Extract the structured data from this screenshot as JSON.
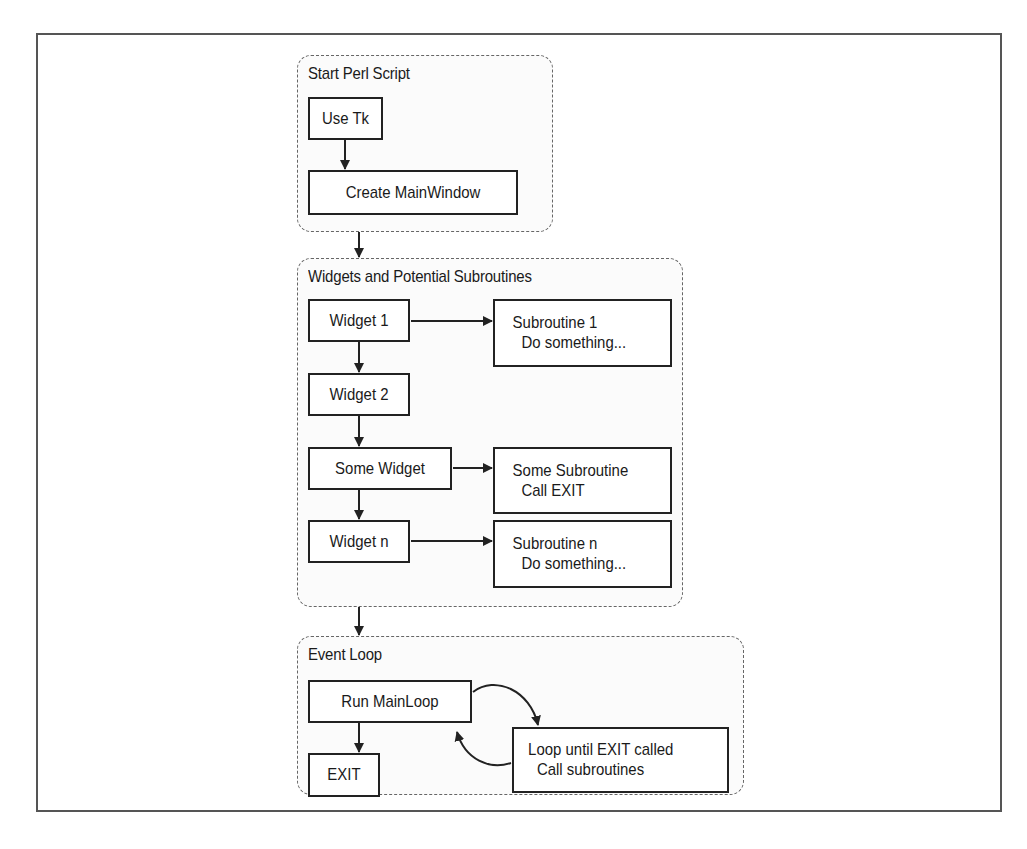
{
  "diagram": {
    "groups": [
      {
        "title": "Start Perl Script",
        "nodes": [
          {
            "label": "Use Tk"
          },
          {
            "label": "Create MainWindow"
          }
        ]
      },
      {
        "title": "Widgets and Potential Subroutines",
        "nodes": [
          {
            "label": "Widget 1"
          },
          {
            "label": "Widget 2"
          },
          {
            "label": "Some Widget"
          },
          {
            "label": "Widget n"
          }
        ],
        "subroutines": [
          {
            "title": "Subroutine 1",
            "detail": "Do something..."
          },
          {
            "title": "Some Subroutine",
            "detail": "Call EXIT"
          },
          {
            "title": "Subroutine n",
            "detail": "Do something..."
          }
        ]
      },
      {
        "title": "Event Loop",
        "nodes": [
          {
            "label": "Run MainLoop"
          },
          {
            "label": "EXIT"
          }
        ],
        "loop_box": {
          "title": "Loop until EXIT called",
          "detail": "Call subroutines"
        }
      }
    ],
    "edges": [
      {
        "from": "Use Tk",
        "to": "Create MainWindow"
      },
      {
        "from": "Start Perl Script",
        "to": "Widgets and Potential Subroutines"
      },
      {
        "from": "Widget 1",
        "to": "Subroutine 1"
      },
      {
        "from": "Widget 1",
        "to": "Widget 2"
      },
      {
        "from": "Widget 2",
        "to": "Some Widget"
      },
      {
        "from": "Some Widget",
        "to": "Some Subroutine"
      },
      {
        "from": "Some Widget",
        "to": "Widget n"
      },
      {
        "from": "Widget n",
        "to": "Subroutine n"
      },
      {
        "from": "Widgets and Potential Subroutines",
        "to": "Event Loop"
      },
      {
        "from": "Run MainLoop",
        "to": "Loop until EXIT called"
      },
      {
        "from": "Loop until EXIT called",
        "to": "Run MainLoop"
      },
      {
        "from": "Run MainLoop",
        "to": "EXIT"
      }
    ]
  }
}
